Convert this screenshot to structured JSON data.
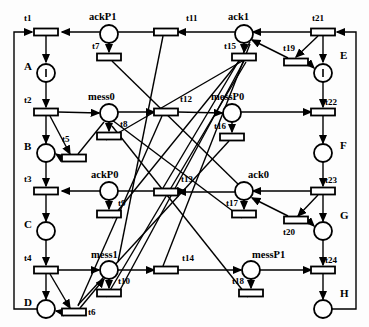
{
  "diagram": {
    "type": "petri-net",
    "title": "",
    "width": 369,
    "height": 327,
    "stroke_color": "#000000",
    "fill_color": "#ffffff"
  },
  "places": [
    {
      "id": "A",
      "label": "A",
      "cx": 46,
      "cy": 73,
      "r": 9,
      "token": true,
      "label_x": 24,
      "label_y": 61,
      "size": "cap"
    },
    {
      "id": "B",
      "label": "B",
      "cx": 46,
      "cy": 153,
      "r": 9,
      "token": false,
      "label_x": 24,
      "label_y": 141,
      "size": "cap"
    },
    {
      "id": "C",
      "label": "C",
      "cx": 46,
      "cy": 231,
      "r": 9,
      "token": false,
      "label_x": 24,
      "label_y": 219,
      "size": "cap"
    },
    {
      "id": "D",
      "label": "D",
      "cx": 46,
      "cy": 309,
      "r": 9,
      "token": false,
      "label_x": 24,
      "label_y": 297,
      "size": "cap"
    },
    {
      "id": "E",
      "label": "E",
      "cx": 323,
      "cy": 73,
      "r": 9,
      "token": true,
      "label_x": 340,
      "label_y": 50,
      "size": "cap"
    },
    {
      "id": "F",
      "label": "F",
      "cx": 323,
      "cy": 153,
      "r": 9,
      "token": false,
      "label_x": 340,
      "label_y": 140,
      "size": "cap"
    },
    {
      "id": "G",
      "label": "G",
      "cx": 323,
      "cy": 231,
      "r": 9,
      "token": false,
      "label_x": 340,
      "label_y": 210,
      "size": "cap"
    },
    {
      "id": "H",
      "label": "H",
      "cx": 323,
      "cy": 309,
      "r": 9,
      "token": false,
      "label_x": 340,
      "label_y": 288,
      "size": "cap"
    },
    {
      "id": "ackP1",
      "label": "ackP1",
      "cx": 109,
      "cy": 34,
      "r": 9,
      "token": false,
      "label_x": 89,
      "label_y": 12,
      "size": "md"
    },
    {
      "id": "ack1",
      "label": "ack1",
      "cx": 244,
      "cy": 34,
      "r": 9,
      "token": false,
      "label_x": 228,
      "label_y": 12,
      "size": "md"
    },
    {
      "id": "mess0",
      "label": "mess0",
      "cx": 109,
      "cy": 113,
      "r": 9,
      "token": false,
      "label_x": 88,
      "label_y": 92,
      "size": "md"
    },
    {
      "id": "messP0",
      "label": "messP0",
      "cx": 232,
      "cy": 113,
      "r": 9,
      "token": false,
      "label_x": 211,
      "label_y": 92,
      "size": "md"
    },
    {
      "id": "ackP0",
      "label": "ackP0",
      "cx": 109,
      "cy": 191,
      "r": 9,
      "token": false,
      "label_x": 91,
      "label_y": 170,
      "size": "md"
    },
    {
      "id": "ack0",
      "label": "ack0",
      "cx": 244,
      "cy": 191,
      "r": 9,
      "token": false,
      "label_x": 248,
      "label_y": 170,
      "size": "md"
    },
    {
      "id": "mess1",
      "label": "mess1",
      "cx": 109,
      "cy": 270,
      "r": 9,
      "token": false,
      "label_x": 91,
      "label_y": 250,
      "size": "md"
    },
    {
      "id": "messP1",
      "label": "messP1",
      "cx": 251,
      "cy": 270,
      "r": 9,
      "token": false,
      "label_x": 252,
      "label_y": 250,
      "size": "md"
    }
  ],
  "transitions": [
    {
      "id": "t1",
      "label": "t1",
      "cx": 46,
      "cy": 32,
      "w": 24,
      "h": 7,
      "orient": "h",
      "label_x": 24,
      "label_y": 14
    },
    {
      "id": "t2",
      "label": "t2",
      "cx": 46,
      "cy": 112,
      "w": 24,
      "h": 7,
      "orient": "h",
      "label_x": 24,
      "label_y": 96
    },
    {
      "id": "t3",
      "label": "t3",
      "cx": 46,
      "cy": 191,
      "w": 24,
      "h": 7,
      "orient": "h",
      "label_x": 24,
      "label_y": 175
    },
    {
      "id": "t4",
      "label": "t4",
      "cx": 46,
      "cy": 270,
      "w": 24,
      "h": 7,
      "orient": "h",
      "label_x": 24,
      "label_y": 254
    },
    {
      "id": "t5",
      "label": "t5",
      "cx": 74,
      "cy": 158,
      "w": 24,
      "h": 7,
      "orient": "h",
      "label_x": 62,
      "label_y": 135
    },
    {
      "id": "t6",
      "label": "t6",
      "cx": 74,
      "cy": 312,
      "w": 24,
      "h": 7,
      "orient": "h",
      "label_x": 88,
      "label_y": 308
    },
    {
      "id": "t7",
      "label": "t7",
      "cx": 109,
      "cy": 57,
      "w": 24,
      "h": 7,
      "orient": "h",
      "label_x": 92,
      "label_y": 42
    },
    {
      "id": "t8",
      "label": "t8",
      "cx": 109,
      "cy": 136,
      "w": 24,
      "h": 7,
      "orient": "h",
      "label_x": 120,
      "label_y": 120
    },
    {
      "id": "t9",
      "label": "t9",
      "cx": 109,
      "cy": 214,
      "w": 24,
      "h": 7,
      "orient": "h",
      "label_x": 118,
      "label_y": 199
    },
    {
      "id": "t10",
      "label": "t10",
      "cx": 109,
      "cy": 293,
      "w": 24,
      "h": 7,
      "orient": "h",
      "label_x": 118,
      "label_y": 277
    },
    {
      "id": "t11",
      "label": "t11",
      "cx": 166,
      "cy": 32,
      "w": 24,
      "h": 7,
      "orient": "h",
      "label_x": 186,
      "label_y": 14
    },
    {
      "id": "t12",
      "label": "t12",
      "cx": 166,
      "cy": 112,
      "w": 24,
      "h": 7,
      "orient": "h",
      "label_x": 180,
      "label_y": 95
    },
    {
      "id": "t13",
      "label": "t13",
      "cx": 166,
      "cy": 192,
      "w": 24,
      "h": 7,
      "orient": "h",
      "label_x": 181,
      "label_y": 175
    },
    {
      "id": "t14",
      "label": "t14",
      "cx": 166,
      "cy": 270,
      "w": 24,
      "h": 7,
      "orient": "h",
      "label_x": 182,
      "label_y": 254
    },
    {
      "id": "t15",
      "label": "t15",
      "cx": 244,
      "cy": 57,
      "w": 24,
      "h": 7,
      "orient": "h",
      "label_x": 224,
      "label_y": 42
    },
    {
      "id": "t16",
      "label": "t16",
      "cx": 232,
      "cy": 137,
      "w": 24,
      "h": 7,
      "orient": "h",
      "label_x": 214,
      "label_y": 122
    },
    {
      "id": "t17",
      "label": "t17",
      "cx": 244,
      "cy": 214,
      "w": 24,
      "h": 7,
      "orient": "h",
      "label_x": 226,
      "label_y": 199
    },
    {
      "id": "t18",
      "label": "t18",
      "cx": 251,
      "cy": 293,
      "w": 24,
      "h": 7,
      "orient": "h",
      "label_x": 232,
      "label_y": 277
    },
    {
      "id": "t19",
      "label": "t19",
      "cx": 296,
      "cy": 62,
      "w": 24,
      "h": 7,
      "orient": "h",
      "label_x": 283,
      "label_y": 44
    },
    {
      "id": "t20",
      "label": "t20",
      "cx": 296,
      "cy": 220,
      "w": 24,
      "h": 7,
      "orient": "h",
      "label_x": 283,
      "label_y": 228
    },
    {
      "id": "t21",
      "label": "t21",
      "cx": 323,
      "cy": 32,
      "w": 24,
      "h": 7,
      "orient": "h",
      "label_x": 312,
      "label_y": 14
    },
    {
      "id": "t22",
      "label": "t22",
      "cx": 323,
      "cy": 112,
      "w": 24,
      "h": 7,
      "orient": "h",
      "label_x": 325,
      "label_y": 98
    },
    {
      "id": "t23",
      "label": "t23",
      "cx": 323,
      "cy": 191,
      "w": 24,
      "h": 7,
      "orient": "h",
      "label_x": 325,
      "label_y": 176
    },
    {
      "id": "t24",
      "label": "t24",
      "cx": 323,
      "cy": 270,
      "w": 24,
      "h": 7,
      "orient": "h",
      "label_x": 325,
      "label_y": 256
    }
  ],
  "arcs": [
    {
      "from": "t1",
      "to": "A",
      "path": "M46,36 L46,62",
      "arrow": "end"
    },
    {
      "from": "A",
      "to": "t2",
      "path": "M46,82 L46,107",
      "arrow": "end"
    },
    {
      "from": "t2",
      "to": "B",
      "path": "M46,116 L46,143",
      "arrow": "end"
    },
    {
      "from": "B",
      "to": "t3",
      "path": "M46,162 L46,186",
      "arrow": "end"
    },
    {
      "from": "t3",
      "to": "C",
      "path": "M46,195 L46,221",
      "arrow": "end"
    },
    {
      "from": "C",
      "to": "t4",
      "path": "M46,240 L46,265",
      "arrow": "end"
    },
    {
      "from": "t4",
      "to": "D",
      "path": "M46,274 L46,299",
      "arrow": "end"
    },
    {
      "from": "D",
      "to": "t1",
      "path": "M37,309 L14,309 L14,32 L32,32",
      "arrow": "end"
    },
    {
      "from": "t21",
      "to": "E",
      "path": "M323,36 L323,62",
      "arrow": "end"
    },
    {
      "from": "E",
      "to": "t22",
      "path": "M323,82 L323,107",
      "arrow": "end"
    },
    {
      "from": "t22",
      "to": "F",
      "path": "M323,116 L323,143",
      "arrow": "end"
    },
    {
      "from": "F",
      "to": "t23",
      "path": "M323,162 L323,186",
      "arrow": "end"
    },
    {
      "from": "t23",
      "to": "G",
      "path": "M323,195 L323,221",
      "arrow": "end"
    },
    {
      "from": "G",
      "to": "t24",
      "path": "M323,240 L323,265",
      "arrow": "end"
    },
    {
      "from": "t24",
      "to": "H",
      "path": "M323,274 L323,299",
      "arrow": "end"
    },
    {
      "from": "H",
      "to": "t21",
      "path": "M332,309 L356,309 L356,32 L337,32",
      "arrow": "end"
    },
    {
      "from": "ackP1",
      "to": "t1",
      "path": "M100,32 L62,32",
      "arrow": "end"
    },
    {
      "from": "ackP1",
      "to": "t7",
      "path": "M109,43 L109,52",
      "arrow": "end"
    },
    {
      "from": "t11",
      "to": "ackP1",
      "path": "M154,32 L118,32",
      "arrow": "start"
    },
    {
      "from": "ack1",
      "to": "t11",
      "path": "M235,32 L178,32",
      "arrow": "end"
    },
    {
      "from": "ack1",
      "to": "t15",
      "path": "M244,43 L244,52",
      "arrow": "end"
    },
    {
      "from": "t21",
      "to": "ack1",
      "path": "M311,32 L253,32",
      "arrow": "end"
    },
    {
      "from": "t2",
      "to": "mess0",
      "path": "M58,112 L99,113",
      "arrow": "end"
    },
    {
      "from": "mess0",
      "to": "t8",
      "path": "M109,122 L109,131",
      "arrow": "end"
    },
    {
      "from": "mess0",
      "to": "t12",
      "path": "M118,112 L154,112",
      "arrow": "end"
    },
    {
      "from": "t12",
      "to": "messP0",
      "path": "M178,112 L222,113",
      "arrow": "end"
    },
    {
      "from": "messP0",
      "to": "t16",
      "path": "M232,122 L232,132",
      "arrow": "end"
    },
    {
      "from": "messP0",
      "to": "t22",
      "path": "M241,112 L311,112",
      "arrow": "end"
    },
    {
      "from": "ackP0",
      "to": "t3",
      "path": "M100,191 L62,191",
      "arrow": "end"
    },
    {
      "from": "ackP0",
      "to": "t9",
      "path": "M109,200 L109,209",
      "arrow": "end"
    },
    {
      "from": "t13",
      "to": "ackP0",
      "path": "M178,191 L118,191",
      "arrow": "start"
    },
    {
      "from": "ack0",
      "to": "t13",
      "path": "M235,192 L178,192",
      "arrow": "end"
    },
    {
      "from": "ack0",
      "to": "t17",
      "path": "M244,200 L244,209",
      "arrow": "end"
    },
    {
      "from": "t23",
      "to": "ack0",
      "path": "M311,191 L253,191",
      "arrow": "end"
    },
    {
      "from": "t4",
      "to": "mess1",
      "path": "M58,270 L99,270",
      "arrow": "end"
    },
    {
      "from": "mess1",
      "to": "t10",
      "path": "M109,279 L109,288",
      "arrow": "end"
    },
    {
      "from": "mess1",
      "to": "t14",
      "path": "M118,270 L154,270",
      "arrow": "end"
    },
    {
      "from": "t14",
      "to": "messP1",
      "path": "M178,270 L241,270",
      "arrow": "end"
    },
    {
      "from": "messP1",
      "to": "t18",
      "path": "M251,279 L251,288",
      "arrow": "end"
    },
    {
      "from": "messP1",
      "to": "t24",
      "path": "M260,270 L311,270",
      "arrow": "end"
    },
    {
      "from": "t2",
      "to": "t5",
      "path": "M50,116 L70,154",
      "arrow": "end"
    },
    {
      "from": "t5",
      "to": "B",
      "path": "M62,158 L56,154",
      "arrow": "end"
    },
    {
      "from": "t5",
      "to": "mess0",
      "path": "M78,154 L104,122",
      "arrow": "none"
    },
    {
      "from": "t4",
      "to": "t6",
      "path": "M50,274 L70,308",
      "arrow": "end"
    },
    {
      "from": "t6",
      "to": "D",
      "path": "M62,312 L56,311",
      "arrow": "end"
    },
    {
      "from": "t6",
      "to": "mess1",
      "path": "M80,308 L104,279",
      "arrow": "end"
    },
    {
      "from": "t21",
      "to": "t19",
      "path": "M318,36 L296,57",
      "arrow": "end"
    },
    {
      "from": "t19",
      "to": "E",
      "path": "M308,62 L314,68",
      "arrow": "end"
    },
    {
      "from": "t19",
      "to": "ack1",
      "path": "M288,58 L252,40",
      "arrow": "end"
    },
    {
      "from": "t23",
      "to": "t20",
      "path": "M318,195 L298,216",
      "arrow": "end"
    },
    {
      "from": "t20",
      "to": "G",
      "path": "M308,220 L314,226",
      "arrow": "end"
    },
    {
      "from": "t20",
      "to": "ack0",
      "path": "M288,216 L252,198",
      "arrow": "end"
    },
    {
      "from": "t15",
      "to": "cross",
      "path": "M244,61 L120,290",
      "arrow": "none"
    },
    {
      "from": "t7",
      "to": "cross",
      "path": "M112,61 L240,186",
      "arrow": "none"
    },
    {
      "from": "t9",
      "to": "cross",
      "path": "M112,218 L240,60",
      "arrow": "none"
    },
    {
      "from": "t17",
      "to": "cross",
      "path": "M242,218 L112,120",
      "arrow": "none"
    },
    {
      "from": "t16",
      "to": "cross",
      "path": "M229,141 L78,305",
      "arrow": "none"
    },
    {
      "from": "t18",
      "to": "cross",
      "path": "M248,297 L112,126",
      "arrow": "none"
    },
    {
      "from": "t8",
      "to": "cross",
      "path": "M106,140 L244,60",
      "arrow": "none"
    },
    {
      "from": "t10",
      "to": "cross",
      "path": "M106,297 L246,62",
      "arrow": "none"
    },
    {
      "from": "t11",
      "to": "cross",
      "path": "M163,36 L118,262",
      "arrow": "none"
    },
    {
      "from": "t12",
      "to": "cross",
      "path": "M162,116 L78,306",
      "arrow": "none"
    },
    {
      "from": "t13",
      "to": "cross",
      "path": "M163,188 L250,42",
      "arrow": "none"
    },
    {
      "from": "t14",
      "to": "cross",
      "path": "M163,266 L250,44",
      "arrow": "none"
    }
  ]
}
